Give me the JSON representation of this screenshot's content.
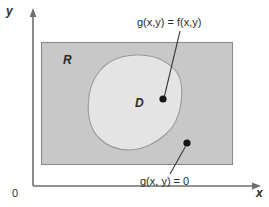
{
  "figure": {
    "kind": "math-diagram",
    "width": 269,
    "height": 207,
    "background": "#ffffff"
  },
  "axes": {
    "y_label": "y",
    "x_label": "x",
    "origin_label": "0",
    "axis_color": "#6e6e6e",
    "y_axis": {
      "x": 33,
      "top": 12,
      "bottom": 186
    },
    "x_axis": {
      "y": 186,
      "left": 33,
      "right": 258
    }
  },
  "regions": [
    {
      "name": "outer-region",
      "label": "R",
      "shape": "rectangle",
      "fill": "#c8c8c8",
      "stroke": "#8a8a8a",
      "bounds": {
        "x": 41,
        "y": 42,
        "width": 192,
        "height": 123
      }
    },
    {
      "name": "inner-region",
      "label": "D",
      "shape": "closed-blob",
      "fill": "#e4e4e4",
      "stroke": "#9a9a9a",
      "bounds": {
        "x": 88,
        "y": 55,
        "width": 94,
        "height": 95
      }
    }
  ],
  "annotations": [
    {
      "name": "inner-point-annotation",
      "text": "g(x,y) = f(x,y)",
      "dot": {
        "x": 163,
        "y": 99
      },
      "leader_from": {
        "x": 180,
        "y": 31
      },
      "leader_to": {
        "x": 164,
        "y": 96
      }
    },
    {
      "name": "outer-point-annotation",
      "text": "g(x, y) = 0",
      "dot": {
        "x": 187,
        "y": 143
      },
      "leader_from": {
        "x": 170,
        "y": 174
      },
      "leader_to": {
        "x": 186,
        "y": 146
      }
    }
  ],
  "colors": {
    "outer_fill": "#c8c8c8",
    "inner_fill": "#e4e4e4",
    "axis": "#6e6e6e",
    "text": "#2b2b2b",
    "dot": "#161616"
  }
}
